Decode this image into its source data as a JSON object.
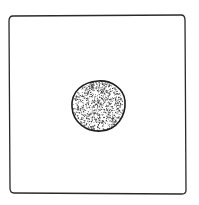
{
  "illustration": {
    "description": "Hand-drawn square frame with a stippled circle at center",
    "frame": {
      "label": "square-frame",
      "stroke_color": "#2a2a2a"
    },
    "dot": {
      "label": "stippled-circle",
      "outline_color": "#1e1e1e",
      "stipple_color": "#3a3a3a"
    },
    "background_color": "#ffffff"
  }
}
